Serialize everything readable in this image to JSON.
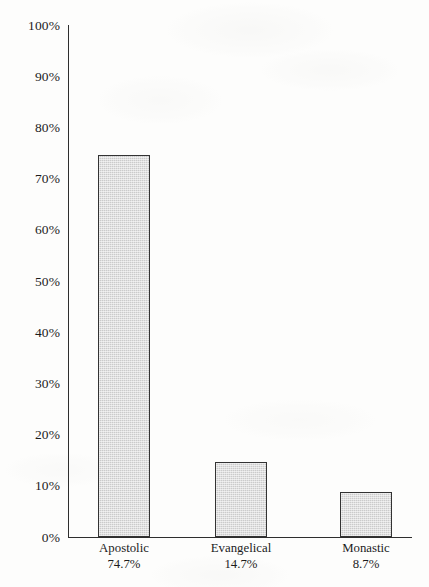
{
  "chart_data": {
    "type": "bar",
    "title": "",
    "subtitle": "",
    "xlabel": "",
    "ylabel": "",
    "categories": [
      "Apostolic",
      "Evangelical",
      "Monastic"
    ],
    "values": [
      74.7,
      14.7,
      8.7
    ],
    "value_labels": [
      "74.7%",
      "14.7%",
      "8.7%"
    ],
    "ylim": [
      0,
      100
    ],
    "y_tick_labels": [
      "100%",
      "90%",
      "80%",
      "70%",
      "60%",
      "50%",
      "40%",
      "30%",
      "20%",
      "10%",
      "0%"
    ],
    "y_tick_values": [
      100,
      90,
      80,
      70,
      60,
      50,
      40,
      30,
      20,
      10,
      0
    ],
    "grid": false,
    "legend": null,
    "units": "percent",
    "bar_fill_color": "#cbcbcb",
    "bar_border_color": "#333333",
    "axis_color": "#2e2e2e",
    "background_color": "#fdfdfc",
    "text_color": "#1c1c1c"
  },
  "axis": {
    "y_ticks": [
      {
        "label": "100%",
        "value": 100
      },
      {
        "label": "90%",
        "value": 90
      },
      {
        "label": "80%",
        "value": 80
      },
      {
        "label": "70%",
        "value": 70
      },
      {
        "label": "60%",
        "value": 60
      },
      {
        "label": "50%",
        "value": 50
      },
      {
        "label": "40%",
        "value": 40
      },
      {
        "label": "30%",
        "value": 30
      },
      {
        "label": "20%",
        "value": 20
      },
      {
        "label": "10%",
        "value": 10
      },
      {
        "label": "0%",
        "value": 0
      }
    ]
  },
  "bars": [
    {
      "category": "Apostolic",
      "value": 74.7,
      "value_label": "74.7%"
    },
    {
      "category": "Evangelical",
      "value": 14.7,
      "value_label": "14.7%"
    },
    {
      "category": "Monastic",
      "value": 8.7,
      "value_label": "8.7%"
    }
  ]
}
